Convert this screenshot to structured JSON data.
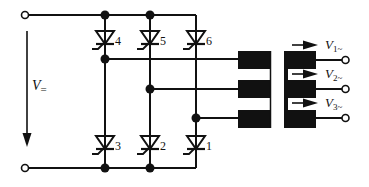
{
  "diagram": {
    "type": "three-phase thyristor bridge inverter with transformer",
    "dc_input": {
      "label_main": "V",
      "label_sub": "=",
      "arrow_direction": "down"
    },
    "thyristors": {
      "top": [
        {
          "id": "4",
          "label": "4"
        },
        {
          "id": "5",
          "label": "5"
        },
        {
          "id": "6",
          "label": "6"
        }
      ],
      "bottom": [
        {
          "id": "3",
          "label": "3"
        },
        {
          "id": "2",
          "label": "2"
        },
        {
          "id": "1",
          "label": "1"
        }
      ]
    },
    "outputs": [
      {
        "label_main": "V",
        "label_sub": "1~"
      },
      {
        "label_main": "V",
        "label_sub": "2~"
      },
      {
        "label_main": "V",
        "label_sub": "3~"
      }
    ],
    "colors": {
      "ink": "#111111",
      "background": "#ffffff"
    }
  }
}
